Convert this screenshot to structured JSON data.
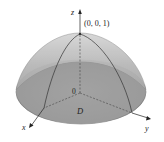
{
  "diagram": {
    "type": "3d-surface",
    "surface": "paraboloid",
    "axes": {
      "x_label": "x",
      "y_label": "y",
      "z_label": "z",
      "origin_label": "0"
    },
    "apex_label": "(0, 0, 1)",
    "region_label": "D",
    "colors": {
      "surface_top": "#c9c9c9",
      "surface_bottom": "#8f8f8f",
      "base_disk": "#9a9a9a",
      "lines": "#333333"
    }
  }
}
